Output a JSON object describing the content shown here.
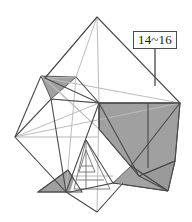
{
  "figure": {
    "type": "origami-folded-model-diagram",
    "width": 192,
    "height": 222,
    "background_color": "#ffffff",
    "line_color_main": "#4a4a4a",
    "line_color_light": "#b5b5b5",
    "fill_gray": "#a0a0a0",
    "fill_gray_dark": "#8f8f8f",
    "fill_white": "#ffffff"
  },
  "annotations": {
    "callout": {
      "label": "14~16",
      "box": {
        "x": 133,
        "y": 31,
        "width": 44,
        "height": 18
      },
      "leader_line": {
        "x1": 155,
        "y1": 49,
        "x2": 155,
        "y2": 86
      }
    }
  },
  "geometry": {
    "top_apex": {
      "x": 97,
      "y": 17
    },
    "center": {
      "x": 99,
      "y": 103
    },
    "left_vertex": {
      "x": 15,
      "y": 137
    },
    "right_vertex": {
      "x": 180,
      "y": 103
    },
    "bottom_apex": {
      "x": 97,
      "y": 212
    },
    "shapes": [
      {
        "name": "top-diamond-face",
        "fill": "#ffffff",
        "points": "97,17 180,103 99,103 15,137 45,78"
      },
      {
        "name": "upper-left-gray-flap",
        "fill": "#a0a0a0",
        "points": "41,76 76,77 51,99"
      },
      {
        "name": "right-large-gray-flap",
        "fill": "#a0a0a0",
        "points": "99,103 180,103 175,161 139,176 99,129"
      },
      {
        "name": "right-lower-gray-spike",
        "fill": "#8f8f8f",
        "points": "139,176 175,161 168,191"
      },
      {
        "name": "bottom-right-gray-wedge",
        "fill": "#a0a0a0",
        "points": "118,186 168,191 131,166"
      },
      {
        "name": "bottom-left-gray-wedge",
        "fill": "#a0a0a0",
        "points": "38,192 82,192 68,170"
      },
      {
        "name": "center-white-flap",
        "fill": "#ffffff",
        "points": "99,103 76,77 51,99 66,192 99,129"
      },
      {
        "name": "bottom-white-triangle",
        "fill": "#ffffff",
        "points": "75,192 97,212 120,186"
      }
    ]
  }
}
